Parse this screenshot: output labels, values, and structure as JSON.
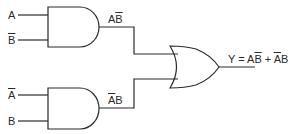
{
  "diagram": {
    "type": "logic-circuit",
    "gates": [
      {
        "id": "and1",
        "kind": "AND",
        "inputs": [
          "A",
          "B̄"
        ],
        "output": "AB̄"
      },
      {
        "id": "and2",
        "kind": "AND",
        "inputs": [
          "Ā",
          "B"
        ],
        "output": "ĀB"
      },
      {
        "id": "or1",
        "kind": "OR",
        "inputs": [
          "AB̄",
          "ĀB"
        ],
        "output": "Y"
      }
    ],
    "labels": {
      "in1_a": "A",
      "in1_b": "B",
      "out1_a": "A",
      "out1_b": "B",
      "in2_a": "A",
      "in2_b": "B",
      "out2_a": "A",
      "out2_b": "B",
      "y_prefix": "Y = A",
      "y_b1": "B",
      "y_plus": " + ",
      "y_a2": "A",
      "y_b2": "B"
    },
    "stroke_color": "#2a2a2a"
  }
}
